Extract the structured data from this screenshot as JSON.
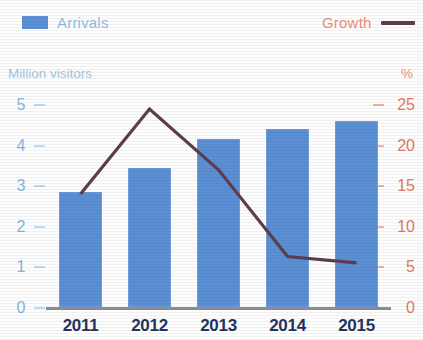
{
  "legend": {
    "arrivals": {
      "label": "Arrivals",
      "color": "#5b8fd4",
      "text_color": "#8fbce6",
      "marker": "bar-swatch"
    },
    "growth": {
      "label": "Growth",
      "color": "#5e3d4f",
      "text_color": "#ef8e76",
      "marker": "line-swatch"
    }
  },
  "axes": {
    "left": {
      "caption": "Million visitors",
      "color": "#7fb6e2",
      "ticks": [
        "5",
        "4",
        "3",
        "2",
        "1",
        "0"
      ],
      "min": 0,
      "max": 5
    },
    "right": {
      "caption": "%",
      "color": "#e07b5e",
      "ticks": [
        "25",
        "20",
        "15",
        "10",
        "5",
        "0"
      ],
      "min": 0,
      "max": 25
    },
    "x": {
      "labels": [
        "2011",
        "2012",
        "2013",
        "2014",
        "2015"
      ],
      "color": "#23345c"
    }
  },
  "chart_data": {
    "type": "bar",
    "title": "",
    "subtitle": "",
    "categories": [
      "2011",
      "2012",
      "2013",
      "2014",
      "2015"
    ],
    "xlabel": "",
    "ylabel": "Million visitors",
    "y2label": "%",
    "ylim": [
      0,
      5
    ],
    "y2lim": [
      0,
      25
    ],
    "ytick_labels": [
      "0",
      "1",
      "2",
      "3",
      "4",
      "5"
    ],
    "y2tick_labels": [
      "0",
      "5",
      "10",
      "15",
      "20",
      "25"
    ],
    "grid": false,
    "legend_position": "top",
    "series": [
      {
        "name": "Arrivals",
        "type": "bar",
        "axis": "left",
        "unit": "Million visitors",
        "color": "#5b8fd4",
        "values": [
          2.85,
          3.45,
          4.15,
          4.4,
          4.6
        ]
      },
      {
        "name": "Growth",
        "type": "line",
        "axis": "right",
        "unit": "%",
        "color": "#5e3d4f",
        "values": [
          14.0,
          24.5,
          17.0,
          6.3,
          5.5
        ]
      }
    ]
  }
}
